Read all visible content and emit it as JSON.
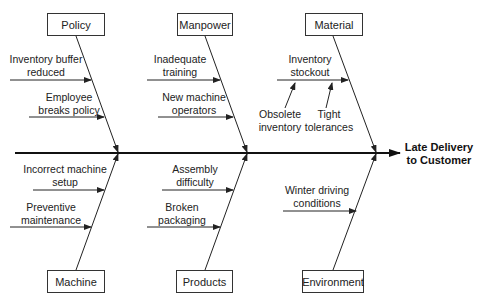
{
  "effect": {
    "line1": "Late Delivery",
    "line2": "to Customer"
  },
  "categories": {
    "policy": {
      "label": "Policy",
      "causes": [
        {
          "line1": "Inventory buffer",
          "line2": "reduced"
        },
        {
          "line1": "Employee",
          "line2": "breaks policy"
        }
      ]
    },
    "manpower": {
      "label": "Manpower",
      "causes": [
        {
          "line1": "Inadequate",
          "line2": "training"
        },
        {
          "line1": "New machine",
          "line2": "operators"
        }
      ]
    },
    "material": {
      "label": "Material",
      "causes": [
        {
          "line1": "Inventory",
          "line2": "stockout",
          "subcauses": [
            {
              "line1": "Obsolete",
              "line2": "inventory"
            },
            {
              "line1": "Tight",
              "line2": "tolerances"
            }
          ]
        }
      ]
    },
    "machine": {
      "label": "Machine",
      "causes": [
        {
          "line1": "Incorrect machine",
          "line2": "setup"
        },
        {
          "line1": "Preventive",
          "line2": "maintenance"
        }
      ]
    },
    "products": {
      "label": "Products",
      "causes": [
        {
          "line1": "Assembly",
          "line2": "difficulty"
        },
        {
          "line1": "Broken",
          "line2": "packaging"
        }
      ]
    },
    "environment": {
      "label": "Environment",
      "causes": [
        {
          "line1": "Winter driving",
          "line2": "conditions"
        }
      ]
    }
  }
}
